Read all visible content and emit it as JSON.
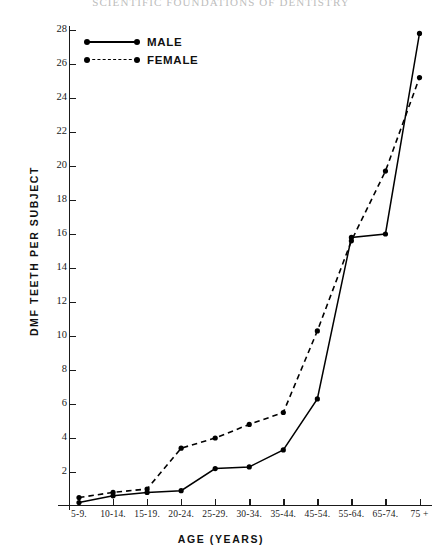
{
  "running_head": "SCIENTIFIC FOUNDATIONS OF DENTISTRY",
  "legend": {
    "items": [
      {
        "label": "MALE",
        "style": "solid",
        "marker": "filled-circle"
      },
      {
        "label": "FEMALE",
        "style": "dashed",
        "marker": "filled-circle"
      }
    ]
  },
  "chart_data": {
    "type": "line",
    "title": "",
    "xlabel": "AGE (YEARS)",
    "ylabel": "DMF TEETH PER SUBJECT",
    "categories": [
      "5-9.",
      "10-14.",
      "15-19.",
      "20-24.",
      "25-29.",
      "30-34.",
      "35-44.",
      "45-54.",
      "55-64.",
      "65-74.",
      "75 +"
    ],
    "series": [
      {
        "name": "MALE",
        "style": "solid",
        "values": [
          0.2,
          0.6,
          0.8,
          0.9,
          2.2,
          2.3,
          3.3,
          6.3,
          15.8,
          16.0,
          27.8
        ]
      },
      {
        "name": "FEMALE",
        "style": "dashed",
        "values": [
          0.5,
          0.8,
          1.0,
          3.4,
          4.0,
          4.8,
          5.5,
          10.3,
          15.6,
          19.7,
          25.2
        ]
      }
    ],
    "ylim": [
      0,
      28
    ],
    "yticks": [
      2,
      4,
      6,
      8,
      10,
      12,
      14,
      16,
      18,
      20,
      22,
      24,
      26,
      28
    ],
    "ytick_labels": [
      "2",
      "4",
      "6",
      "8",
      "10",
      "12",
      "14",
      "16",
      "18",
      "20",
      "22",
      "24",
      "26",
      "28"
    ],
    "grid": false,
    "legend_position": "top-left"
  },
  "colors": {
    "ink": "#1a1a1a",
    "background": "#ffffff",
    "running_head": "#bdbdbd"
  }
}
